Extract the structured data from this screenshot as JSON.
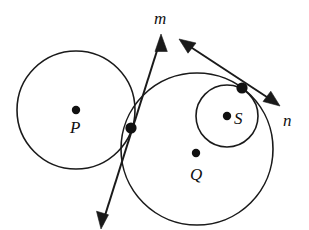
{
  "figure": {
    "kind": "geometry-diagram",
    "background_color": "#ffffff",
    "ink_color": "#1a1a1a"
  },
  "circles": [
    {
      "id": "circle-p",
      "center_label": "P",
      "cx": 76,
      "cy": 110,
      "r": 59,
      "stroke_width": 1.6
    },
    {
      "id": "circle-q",
      "center_label": "Q",
      "cx": 197,
      "cy": 149,
      "r": 76,
      "stroke_width": 1.6
    },
    {
      "id": "circle-s",
      "center_label": "S",
      "cx": 227,
      "cy": 116,
      "r": 31,
      "stroke_width": 1.6
    }
  ],
  "center_points": [
    {
      "id": "center-point-p",
      "label": "P",
      "x": 76,
      "y": 110,
      "r": 4.2,
      "label_x": 70,
      "label_y": 133
    },
    {
      "id": "center-point-q",
      "label": "Q",
      "x": 196,
      "y": 153,
      "r": 4.2,
      "label_x": 190,
      "label_y": 180
    },
    {
      "id": "center-point-s",
      "label": "S",
      "x": 227,
      "y": 116,
      "r": 4.2,
      "label_x": 234,
      "label_y": 124
    }
  ],
  "tangency_points": [
    {
      "id": "tangency-point-pq",
      "x": 131,
      "y": 128,
      "r": 5.6
    },
    {
      "id": "tangency-point-qs",
      "x": 242,
      "y": 88,
      "r": 5.6
    }
  ],
  "lines": [
    {
      "id": "line-m",
      "label": "m",
      "label_x": 154,
      "label_y": 24,
      "through_point": "tangency-point-pq",
      "x1": 161,
      "y1": 38,
      "x2": 102,
      "y2": 225,
      "stroke_width": 2.0,
      "arrow_start": true,
      "arrow_end": true
    },
    {
      "id": "line-n",
      "label": "n",
      "label_x": 283,
      "label_y": 126,
      "through_point": "tangency-point-qs",
      "x1": 182,
      "y1": 41,
      "x2": 277,
      "y2": 103,
      "stroke_width": 2.0,
      "arrow_start": true,
      "arrow_end": true
    }
  ],
  "labels": [
    {
      "id": "label-m",
      "text": "m"
    },
    {
      "id": "label-n",
      "text": "n"
    },
    {
      "id": "label-p",
      "text": "P"
    },
    {
      "id": "label-q",
      "text": "Q"
    },
    {
      "id": "label-s",
      "text": "S"
    }
  ]
}
